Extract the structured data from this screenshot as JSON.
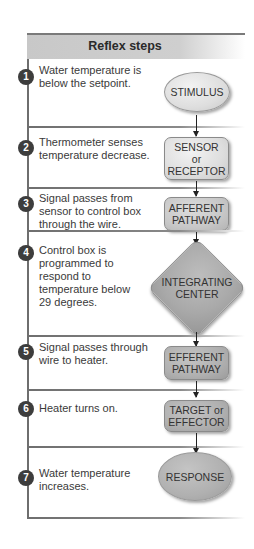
{
  "title": "Reflex steps",
  "steps": [
    {
      "num": "1",
      "text": "Water temperature is below the setpoint.",
      "shape": "STIMULUS",
      "shape_type": "ellipse"
    },
    {
      "num": "2",
      "text": "Thermometer senses temperature decrease.",
      "shape_line1": "SENSOR",
      "shape_line2": "or",
      "shape_line3": "RECEPTOR",
      "shape_type": "rounded-rect"
    },
    {
      "num": "3",
      "text": "Signal passes from sensor to control box through the wire.",
      "shape_line1": "AFFERENT",
      "shape_line2": "PATHWAY",
      "shape_type": "rounded-rect"
    },
    {
      "num": "4",
      "text": "Control box is programmed to respond to temperature below 29 degrees.",
      "shape_line1": "INTEGRATING",
      "shape_line2": "CENTER",
      "shape_type": "diamond"
    },
    {
      "num": "5",
      "text": "Signal passes through wire to heater.",
      "shape_line1": "EFFERENT",
      "shape_line2": "PATHWAY",
      "shape_type": "rounded-rect"
    },
    {
      "num": "6",
      "text": "Heater turns on.",
      "shape_line1": "TARGET or",
      "shape_line2": "EFFECTOR",
      "shape_type": "rounded-rect"
    },
    {
      "num": "7",
      "text": "Water temperature increases.",
      "shape": "RESPONSE",
      "shape_type": "ellipse"
    }
  ],
  "colors": {
    "header_bg": "#cccccc",
    "frame_line": "#6e6e6e",
    "step_badge": "#3d3d3d",
    "shape_light": "#dedede",
    "shape_mid": "#c8c8c8",
    "shape_dark": "#a9a9a9"
  }
}
